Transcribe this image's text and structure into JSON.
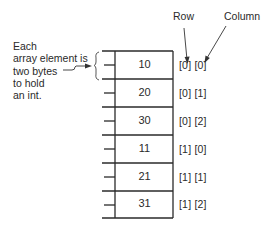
{
  "header": {
    "row_label": "Row",
    "column_label": "Column"
  },
  "annotation": {
    "lines": [
      "Each",
      "array element is",
      "two bytes",
      "to hold",
      "an int."
    ]
  },
  "array": {
    "cells": [
      {
        "value": "10",
        "index": "[0] [0]"
      },
      {
        "value": "20",
        "index": "[0] [1]"
      },
      {
        "value": "30",
        "index": "[0] [2]"
      },
      {
        "value": "11",
        "index": "[1] [0]"
      },
      {
        "value": "21",
        "index": "[1] [1]"
      },
      {
        "value": "31",
        "index": "[1] [2]"
      }
    ]
  }
}
